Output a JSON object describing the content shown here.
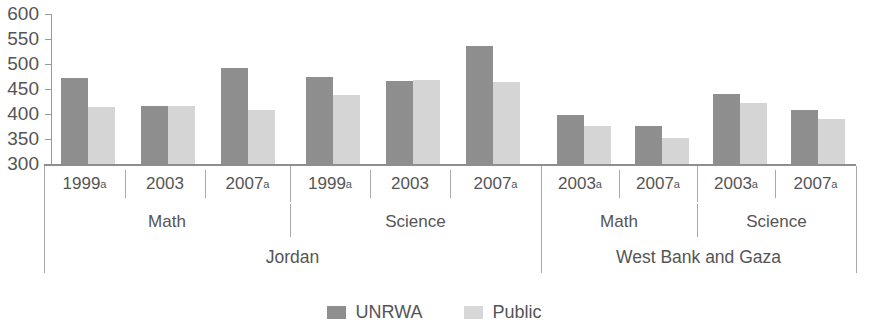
{
  "chart_data": {
    "type": "bar",
    "title": "",
    "subtitle": "",
    "xlabel": "",
    "ylabel": "",
    "ylim": [
      300,
      600
    ],
    "y_ticks": [
      300,
      350,
      400,
      450,
      500,
      550,
      600
    ],
    "grid": false,
    "legend_position": "bottom",
    "categories": [
      "Jordan / Math / 1999a",
      "Jordan / Math / 2003",
      "Jordan / Math / 2007a",
      "Jordan / Science / 1999a",
      "Jordan / Science / 2003",
      "Jordan / Science / 2007a",
      "West Bank and Gaza / Math / 2003a",
      "West Bank and Gaza / Math / 2007a",
      "West Bank and Gaza / Science / 2003a",
      "West Bank and Gaza / Science / 2007a"
    ],
    "series": [
      {
        "name": "UNRWA",
        "color": "#8c8c8c",
        "values": [
          472,
          418,
          492,
          474,
          466,
          536,
          400,
          378,
          442,
          410
        ]
      },
      {
        "name": "Public",
        "color": "#dcdcdc",
        "values": [
          416,
          418,
          410,
          440,
          468,
          464,
          378,
          354,
          424,
          392
        ]
      }
    ],
    "groups": [
      {
        "country": "Jordan",
        "subjects": [
          {
            "subject": "Math",
            "years": [
              "1999a",
              "2003",
              "2007a"
            ]
          },
          {
            "subject": "Science",
            "years": [
              "1999a",
              "2003",
              "2007a"
            ]
          }
        ]
      },
      {
        "country": "West Bank and Gaza",
        "subjects": [
          {
            "subject": "Math",
            "years": [
              "2003a",
              "2007a"
            ]
          },
          {
            "subject": "Science",
            "years": [
              "2003a",
              "2007a"
            ]
          }
        ]
      }
    ]
  },
  "axis": {
    "y_labels": [
      "600",
      "550",
      "500",
      "450",
      "400",
      "350",
      "300"
    ]
  },
  "year_labels": {
    "jordan_math_1999": "1999",
    "jordan_math_2003": "2003",
    "jordan_math_2007": "2007",
    "jordan_science_1999": "1999",
    "jordan_science_2003": "2003",
    "jordan_science_2007": "2007",
    "wbg_math_2003": "2003",
    "wbg_math_2007": "2007",
    "wbg_science_2003": "2003",
    "wbg_science_2007": "2007"
  },
  "footnote_marker": "a",
  "subject_labels": {
    "jordan_math": "Math",
    "jordan_science": "Science",
    "wbg_math": "Math",
    "wbg_science": "Science"
  },
  "country_labels": {
    "jordan": "Jordan",
    "wbg": "West Bank and Gaza"
  },
  "legend": {
    "unrwa": "UNRWA",
    "public": "Public"
  },
  "colors": {
    "unrwa": "#8c8c8c",
    "public": "#dcdcdc",
    "axis": "#9a9a9a",
    "text": "#555555"
  }
}
